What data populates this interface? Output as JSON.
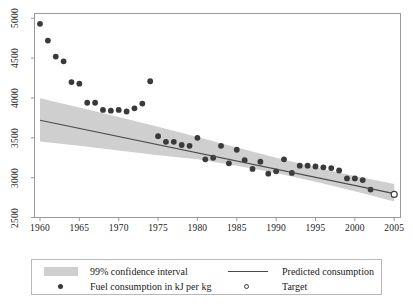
{
  "chart_data": {
    "type": "scatter",
    "title": "",
    "xlabel": "",
    "ylabel": "",
    "xlim": [
      1959.3,
      2005.8
    ],
    "ylim": [
      2500,
      5060
    ],
    "xticks": [
      1960,
      1965,
      1970,
      1975,
      1980,
      1985,
      1990,
      1995,
      2000,
      2005
    ],
    "yticks": [
      2500,
      3000,
      3500,
      4000,
      4500,
      5000
    ],
    "grid": false,
    "legend_position": "below-axes",
    "series": [
      {
        "name": "Fuel consumption in kJ per kg",
        "type": "scatter",
        "marker": "filled-circle",
        "color": "#3a3a3a",
        "x": [
          1960,
          1961,
          1962,
          1963,
          1964,
          1965,
          1966,
          1967,
          1968,
          1969,
          1970,
          1971,
          1972,
          1973,
          1974,
          1975,
          1976,
          1977,
          1978,
          1979,
          1980,
          1981,
          1982,
          1983,
          1984,
          1985,
          1986,
          1987,
          1988,
          1989,
          1990,
          1991,
          1992,
          1993,
          1994,
          1995,
          1996,
          1997,
          1998,
          1999,
          2000,
          2001,
          2002
        ],
        "y": [
          4930,
          4720,
          4520,
          4460,
          4200,
          4180,
          3940,
          3940,
          3850,
          3840,
          3850,
          3830,
          3870,
          3930,
          4210,
          3520,
          3450,
          3450,
          3410,
          3400,
          3500,
          3230,
          3250,
          3400,
          3180,
          3350,
          3220,
          3110,
          3200,
          3050,
          3080,
          3230,
          3060,
          3150,
          3150,
          3140,
          3130,
          3120,
          3090,
          2990,
          2990,
          2970,
          2850
        ]
      },
      {
        "name": "Predicted consumption",
        "type": "line",
        "color": "#4a4a4a",
        "x": [
          1960,
          2005
        ],
        "y": [
          3720,
          2800
        ]
      },
      {
        "name": "Target",
        "type": "scatter",
        "marker": "open-circle",
        "color": "#3a3a3a",
        "x": [
          2005
        ],
        "y": [
          2790
        ]
      }
    ],
    "confidence_band": {
      "name": "99% confidence interval",
      "level": "99%",
      "color": "#cfcfcf",
      "x": [
        1960,
        1965,
        1970,
        1975,
        1980,
        1985,
        1990,
        1995,
        2000,
        2005
      ],
      "upper": [
        3995,
        3880,
        3760,
        3640,
        3510,
        3380,
        3250,
        3130,
        3020,
        2920
      ],
      "lower": [
        3455,
        3400,
        3340,
        3280,
        3230,
        3150,
        3060,
        2950,
        2830,
        2700
      ]
    }
  },
  "axes": {
    "ytick_labels": [
      "2500",
      "3000",
      "3500",
      "4000",
      "4500",
      "5000"
    ],
    "xtick_labels": [
      "1960",
      "1965",
      "1970",
      "1975",
      "1980",
      "1985",
      "1990",
      "1995",
      "2000",
      "2005"
    ]
  },
  "legend": {
    "entries": [
      {
        "label": "99% confidence interval",
        "marker": "band"
      },
      {
        "label": "Predicted consumption",
        "marker": "line"
      },
      {
        "label": "Fuel consumption in kJ per kg",
        "marker": "filled-circle"
      },
      {
        "label": "Target",
        "marker": "open-circle"
      }
    ]
  },
  "colors": {
    "point": "#3a3a3a",
    "line": "#4a4a4a",
    "band": "#cfcfcf",
    "frame": "#9a9a9a",
    "background": "#ffffff"
  }
}
